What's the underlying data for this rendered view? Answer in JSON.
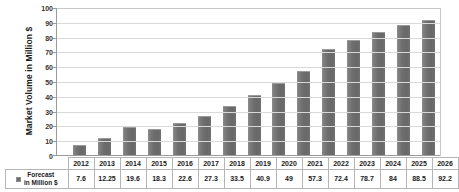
{
  "chart_data": {
    "type": "bar",
    "title": "",
    "xlabel": "",
    "ylabel": "Market Volume in Million $",
    "categories": [
      "2012",
      "2013",
      "2014",
      "2015",
      "2016",
      "2017",
      "2018",
      "2019",
      "2020",
      "2021",
      "2022",
      "2023",
      "2024",
      "2025",
      "2026"
    ],
    "values": [
      7.6,
      12.25,
      19.6,
      18.3,
      22.6,
      27.3,
      33.5,
      40.9,
      49,
      57.3,
      72.4,
      78.7,
      84,
      88.5,
      92.2
    ],
    "value_labels": [
      "7.6",
      "12.25",
      "19.6",
      "18.3",
      "22.6",
      "27.3",
      "33.5",
      "40.9",
      "49",
      "57.3",
      "72.4",
      "78.7",
      "84",
      "88.5",
      "92.2"
    ],
    "ylim": [
      0,
      100
    ],
    "ytick_values": [
      0,
      10,
      20,
      30,
      40,
      50,
      60,
      70,
      80,
      90,
      100
    ],
    "ytick_labels": [
      "0",
      "10",
      "20",
      "30",
      "40",
      "50",
      "60",
      "70",
      "80",
      "90",
      "100"
    ],
    "grid": true,
    "legend": [
      "Forecast in Million $"
    ],
    "legend_position": "bottom-left-table",
    "series": [
      {
        "name": "Forecast in Million $",
        "color": "#6d6d6d",
        "values": [
          7.6,
          12.25,
          19.6,
          18.3,
          22.6,
          27.3,
          33.5,
          40.9,
          49,
          57.3,
          72.4,
          78.7,
          84,
          88.5,
          92.2
        ]
      }
    ]
  },
  "axis": {
    "y_title": "Market Volume in Million $",
    "y_labels": [
      "100",
      "90",
      "80",
      "70",
      "60",
      "50",
      "40",
      "30",
      "20",
      "10",
      "0"
    ]
  },
  "table": {
    "legend_label_line1": "Forecast",
    "legend_label_line2": "in Million $",
    "legend_swatch_color": "#6d6d6d",
    "year_headers": [
      "2012",
      "2013",
      "2014",
      "2015",
      "2016",
      "2017",
      "2018",
      "2019",
      "2020",
      "2021",
      "2022",
      "2023",
      "2024",
      "2025",
      "2026"
    ],
    "values": [
      "7.6",
      "12.25",
      "19.6",
      "18.3",
      "22.6",
      "27.3",
      "33.5",
      "40.9",
      "49",
      "57.3",
      "72.4",
      "78.7",
      "84",
      "88.5",
      "92.2"
    ]
  },
  "colors": {
    "bar": "#6d6d6d",
    "grid": "#d9d9d9",
    "axis": "#9a9a9a",
    "text": "#1a1a1a"
  }
}
